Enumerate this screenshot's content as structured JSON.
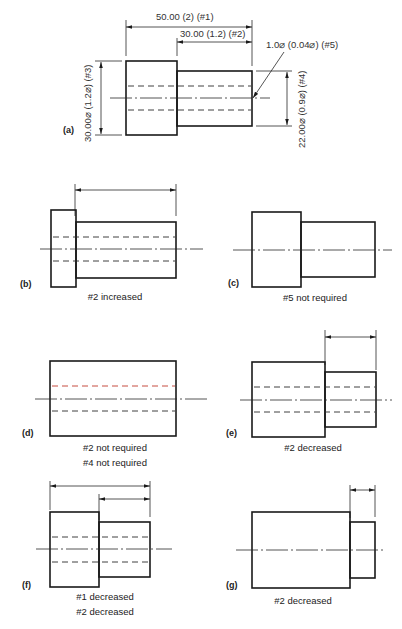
{
  "figure": {
    "panels": [
      {
        "id": "a",
        "tag": "(a)",
        "dimensions": {
          "overall_length": "50.00 (2) (#1)",
          "step_length": "30.00 (1.2) (#2)",
          "hole_diameter": "1.0⌀ (0.04⌀) (#5)",
          "large_diameter": "30.00⌀ (1.2⌀) (#3)",
          "small_diameter": "22.00⌀ (0.9⌀) (#4)"
        }
      },
      {
        "id": "b",
        "tag": "(b)",
        "caption_lines": [
          "#2 increased"
        ]
      },
      {
        "id": "c",
        "tag": "(c)",
        "caption_lines": [
          "#5 not required"
        ]
      },
      {
        "id": "d",
        "tag": "(d)",
        "caption_lines": [
          "#2 not required",
          "#4 not required"
        ]
      },
      {
        "id": "e",
        "tag": "(e)",
        "caption_lines": [
          "#2 decreased"
        ]
      },
      {
        "id": "f",
        "tag": "(f)",
        "caption_lines": [
          "#1 decreased",
          "#2 decreased"
        ]
      },
      {
        "id": "g",
        "tag": "(g)",
        "caption_lines": [
          "#2 decreased"
        ]
      }
    ],
    "colors": {
      "line": "#1a1a1a",
      "highlight_hidden_line": "#c0392b",
      "highlight_text": "#2e7d32"
    }
  }
}
